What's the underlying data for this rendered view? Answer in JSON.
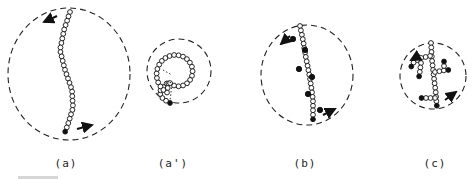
{
  "figure": {
    "panels": [
      {
        "id": "a",
        "label": "(a)",
        "label_x": 66,
        "description": "extended chain, ends at poles"
      },
      {
        "id": "a_prime",
        "label": "(a')",
        "label_x": 173,
        "description": "coiled chain"
      },
      {
        "id": "b",
        "label": "(b)",
        "label_x": 305,
        "description": "chain with side groups"
      },
      {
        "id": "c",
        "label": "(c)",
        "label_x": 435,
        "description": "branched chain"
      }
    ],
    "colors": {
      "stroke": "#1a1a1a",
      "bead_fill_open": "#ffffff",
      "bead_fill_solid": "#111111"
    }
  }
}
